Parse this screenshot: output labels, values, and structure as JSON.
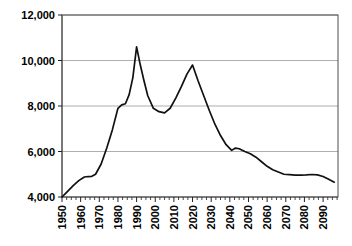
{
  "chart_data": {
    "type": "line",
    "title": "",
    "subtitle": "",
    "xlabel": "",
    "ylabel": "",
    "grid": true,
    "legend": false,
    "legend_position": "none",
    "xlim": [
      1950,
      2098
    ],
    "ylim": [
      4000,
      12000
    ],
    "yticks": [
      4000,
      6000,
      8000,
      10000,
      12000
    ],
    "ytick_labels": [
      "4,000",
      "6,000",
      "8,000",
      "10,000",
      "12,000"
    ],
    "xticks": [
      1950,
      1960,
      1970,
      1980,
      1990,
      2000,
      2010,
      2020,
      2030,
      2040,
      2050,
      2060,
      2070,
      2080,
      2090
    ],
    "xtick_labels": [
      "1950",
      "1960",
      "1970",
      "1980",
      "1990",
      "2000",
      "2010",
      "2020",
      "2030",
      "2040",
      "2050",
      "2060",
      "2070",
      "2080",
      "2090"
    ],
    "xtick_rotation": 90,
    "minor_tick_interval": 2.5,
    "line_color": "#111111",
    "grid_color": "#9a9a9a",
    "border_color": "#4d4d4d",
    "series": [
      {
        "name": "series-1",
        "x": [
          1950,
          1953,
          1956,
          1959,
          1962,
          1964,
          1966,
          1968,
          1971,
          1974,
          1977,
          1980,
          1982,
          1984,
          1986,
          1988,
          1990,
          1992,
          1994,
          1996,
          1999,
          2002,
          2005,
          2008,
          2011,
          2014,
          2017,
          2020,
          2023,
          2026,
          2029,
          2032,
          2035,
          2038,
          2041,
          2043,
          2045,
          2048,
          2051,
          2054,
          2057,
          2060,
          2063,
          2066,
          2069,
          2072,
          2075,
          2078,
          2081,
          2084,
          2087,
          2090,
          2093,
          2096
        ],
        "y": [
          4000,
          4250,
          4500,
          4720,
          4880,
          4900,
          4910,
          5000,
          5450,
          6150,
          6950,
          7900,
          8050,
          8100,
          8500,
          9250,
          10600,
          9800,
          9100,
          8450,
          7900,
          7750,
          7700,
          7900,
          8350,
          8850,
          9400,
          9800,
          9100,
          8450,
          7800,
          7200,
          6700,
          6300,
          6050,
          6150,
          6120,
          6000,
          5900,
          5750,
          5550,
          5350,
          5200,
          5100,
          5000,
          4980,
          4960,
          4960,
          4970,
          4990,
          4970,
          4900,
          4780,
          4650
        ]
      }
    ]
  }
}
